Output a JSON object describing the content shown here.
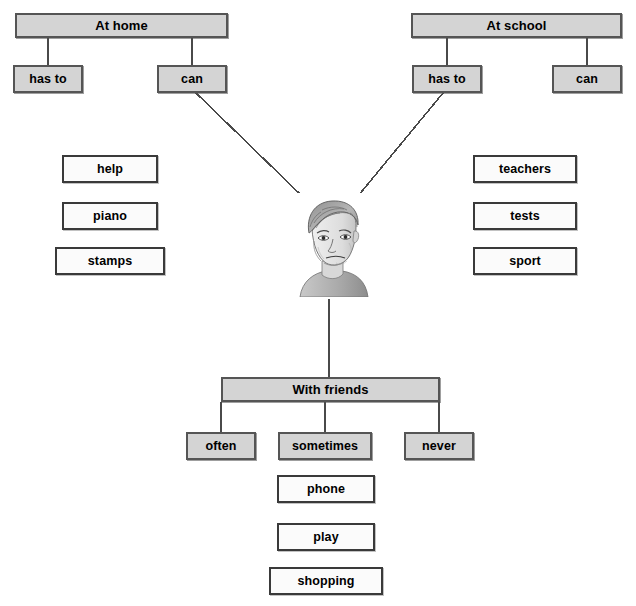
{
  "diagram": {
    "colors": {
      "shaded_fill": "#d4d4d4",
      "plain_fill": "#fbfbfb",
      "border_dark": "#555555",
      "border_plain": "#3a3a3a",
      "line": "#4a4a4a",
      "page_background": "#ffffff",
      "text": "#000000"
    },
    "branches": {
      "at_home": {
        "header": "At home",
        "children": [
          "has to",
          "can"
        ],
        "words": [
          "help",
          "piano",
          "stamps"
        ]
      },
      "at_school": {
        "header": "At school",
        "children": [
          "has to",
          "can"
        ],
        "words": [
          "teachers",
          "tests",
          "sport"
        ]
      },
      "with_friends": {
        "header": "With friends",
        "children": [
          "often",
          "sometimes",
          "never"
        ],
        "words": [
          "phone",
          "play",
          "shopping"
        ]
      }
    },
    "centre": {
      "image_name": "boy-portrait-sketch",
      "description": "Pencil sketch portrait of a boy with short hair"
    }
  }
}
